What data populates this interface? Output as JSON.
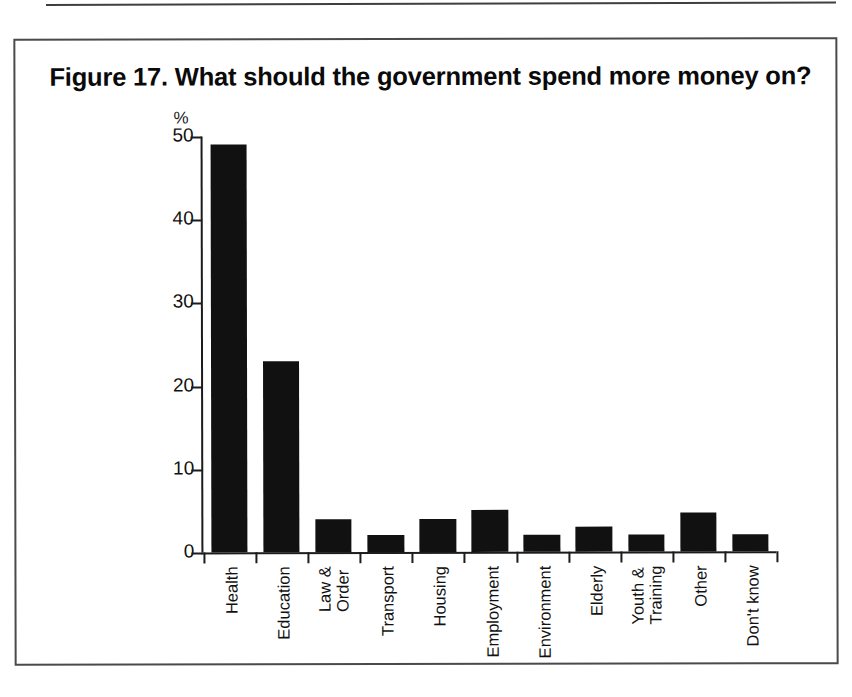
{
  "page": {
    "top_rule": "horizontal-rule"
  },
  "figure": {
    "title": "Figure 17. What should the government spend more money on?"
  },
  "chart_data": {
    "type": "bar",
    "title": "Figure 17. What should the government spend more money on?",
    "xlabel": "",
    "ylabel": "%",
    "ylim": [
      0,
      50
    ],
    "yticks": [
      0,
      10,
      20,
      30,
      40,
      50
    ],
    "ytick_labels": [
      "0",
      "10",
      "20",
      "30",
      "40",
      "50"
    ],
    "grid": false,
    "legend": "none",
    "bar_color": "#111111",
    "categories": [
      "Health",
      "Education",
      "Law &\nOrder",
      "Transport",
      "Housing",
      "Employment",
      "Environment",
      "Elderly",
      "Youth &\nTraining",
      "Other",
      "Don't know"
    ],
    "values": [
      49,
      23,
      4,
      2,
      4,
      5,
      2,
      3,
      2,
      4.7,
      2
    ]
  }
}
